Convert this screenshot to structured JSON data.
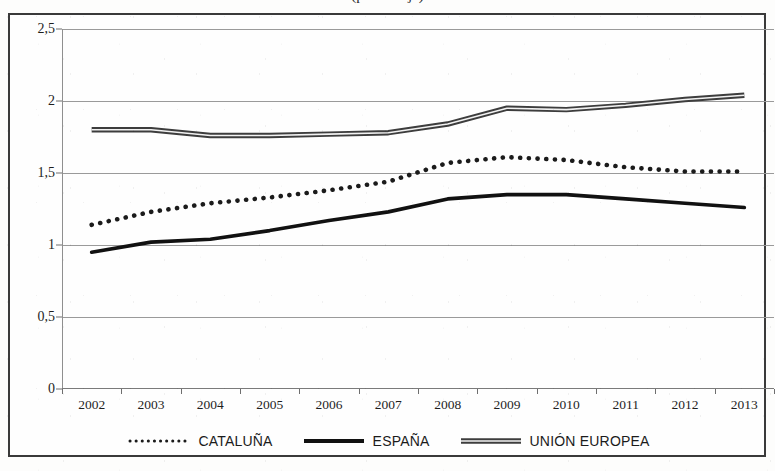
{
  "figure": {
    "title_cropped": "(porcentaje)",
    "frame_border_color": "#3a3a3a"
  },
  "axes": {
    "y_ticks": [
      "2,5",
      "2",
      "1,5",
      "1",
      "0,5",
      "0"
    ],
    "x_ticks": [
      "2002",
      "2003",
      "2004",
      "2005",
      "2006",
      "2007",
      "2008",
      "2009",
      "2010",
      "2011",
      "2012",
      "2013"
    ]
  },
  "legend": {
    "entries": [
      {
        "label": "CATALUÑA",
        "style": "dotted",
        "color": "#1b1b1b"
      },
      {
        "label": "ESPAÑA",
        "style": "solid",
        "color": "#111111"
      },
      {
        "label": "UNIÓN EUROPEA",
        "style": "solid",
        "color": "#777777"
      }
    ]
  },
  "chart_data": {
    "type": "line",
    "title": "(porcentaje)",
    "xlabel": "",
    "ylabel": "",
    "ylim": [
      0,
      2.5
    ],
    "ytick_values": [
      0,
      0.5,
      1,
      1.5,
      2,
      2.5
    ],
    "grid": true,
    "legend_position": "bottom",
    "categories": [
      "2002",
      "2003",
      "2004",
      "2005",
      "2006",
      "2007",
      "2008",
      "2009",
      "2010",
      "2011",
      "2012",
      "2013"
    ],
    "series": [
      {
        "name": "CATALUÑA",
        "style": "dotted",
        "color": "#1b1b1b",
        "values": [
          1.14,
          1.23,
          1.29,
          1.33,
          1.38,
          1.44,
          1.57,
          1.61,
          1.59,
          1.54,
          1.51,
          1.51
        ]
      },
      {
        "name": "ESPAÑA",
        "style": "solid",
        "color": "#111111",
        "values": [
          0.95,
          1.02,
          1.04,
          1.1,
          1.17,
          1.23,
          1.32,
          1.35,
          1.35,
          1.32,
          1.29,
          1.26
        ]
      },
      {
        "name": "UNIÓN EUROPEA",
        "style": "solid",
        "color": "#777777",
        "values": [
          1.8,
          1.8,
          1.76,
          1.76,
          1.77,
          1.78,
          1.84,
          1.95,
          1.94,
          1.97,
          2.01,
          2.04
        ]
      }
    ]
  }
}
